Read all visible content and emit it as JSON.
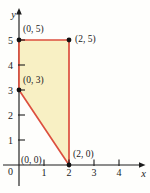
{
  "figure": {
    "axes": {
      "x_label": "x",
      "y_label": "y",
      "origin_label": "0",
      "x_tick_labels": [
        "1",
        "2",
        "3",
        "4"
      ],
      "y_tick_labels": [
        "1",
        "2",
        "3",
        "4",
        "5"
      ],
      "axis_color": "#1c1c1c"
    },
    "region": {
      "vertices": [
        [
          0,
          5
        ],
        [
          2,
          5
        ],
        [
          2,
          0
        ],
        [
          0,
          3
        ]
      ],
      "fill_color": "#f8f0c4",
      "stroke_color": "#dc4f3e"
    },
    "labeled_points": [
      {
        "label": "(0, 5)",
        "x": 0,
        "y": 5,
        "dot": true
      },
      {
        "label": "(2, 5)",
        "x": 2,
        "y": 5,
        "dot": true
      },
      {
        "label": "(0, 3)",
        "x": 0,
        "y": 3,
        "dot": true
      },
      {
        "label": "(0, 0)",
        "x": 0,
        "y": 0,
        "dot": false
      },
      {
        "label": "(2, 0)",
        "x": 2,
        "y": 0,
        "dot": true
      }
    ],
    "dot_color": "#111111"
  }
}
